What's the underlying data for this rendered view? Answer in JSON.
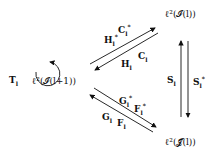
{
  "diagram": {
    "nodes": {
      "center": "ℓ²(𝓘(l+1))",
      "top_right": "ℓ²(𝓘(l))",
      "bottom_right": "ℓ²(𝓙(l))"
    },
    "self_loop_label": "T",
    "self_loop_sub": "l",
    "edges": {
      "upper_top_a": {
        "base": "H",
        "sub": "l",
        "sup": "*"
      },
      "upper_top_b": {
        "base": "C",
        "sub": "l",
        "sup": "*"
      },
      "upper_bottom_a": {
        "base": "C",
        "sub": "l"
      },
      "upper_bottom_b": {
        "base": "H",
        "sub": "l"
      },
      "lower_top_a": {
        "base": "G",
        "sub": "l",
        "sup": "*"
      },
      "lower_top_b": {
        "base": "F",
        "sub": "l",
        "sup": "*"
      },
      "lower_bottom_a": {
        "base": "G",
        "sub": "l"
      },
      "lower_bottom_b": {
        "base": "F",
        "sub": "l"
      },
      "vert_left": {
        "base": "S",
        "sub": "l"
      },
      "vert_right": {
        "base": "S",
        "sub": "l",
        "sup": "*"
      }
    }
  }
}
